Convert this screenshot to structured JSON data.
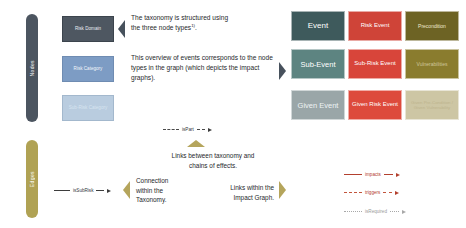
{
  "rails": {
    "nodes_label": "Nodes",
    "edges_label": "Edges"
  },
  "taxonomy_nodes": {
    "risk_domain": "Risk Domain",
    "risk_category": "Risk Category",
    "sub_risk_category": "Sub-Risk Category"
  },
  "event_grid": {
    "row1": {
      "event": "Event",
      "risk_event": "Risk Event",
      "precondition": "Precondition"
    },
    "row2": {
      "sub_event": "Sub-Event",
      "sub_risk_event": "Sub-Risk Event",
      "vulnerabilities": "Vulnerabilities"
    },
    "row3": {
      "given_event": "Given Event",
      "given_risk_event": "Given Risk Event",
      "given_precondition": "Given Pre-Condition / Given Vulnerability"
    }
  },
  "annotations": {
    "paragraph1_line1": "The taxonomy is structured using",
    "paragraph1_line2": "the three node types",
    "paragraph1_superscript": "1)",
    "paragraph1_tail": ".",
    "paragraph2": "This overview of events corresponds to the node types in the graph (which depicts the impact graphs).",
    "links_between_line1": "Links between taxonomy and",
    "links_between_line2": "chains of effects.",
    "connection_taxonomy_line1": "Connection",
    "connection_taxonomy_line2": "within the",
    "connection_taxonomy_line3": "Taxonomy.",
    "links_impact_line1": "Links within the",
    "links_impact_line2": "Impact Graph."
  },
  "edge_labels": {
    "is_part": "isPart",
    "is_sub_risk": "isSubRisk"
  },
  "edge_legend": [
    {
      "label": "impacts",
      "style": "solid",
      "color": "#b3402e"
    },
    {
      "label": "triggers",
      "style": "dashed",
      "color": "#c2553c"
    },
    {
      "label": "isRequired",
      "style": "dotted",
      "color": "#a8a8a8"
    }
  ],
  "colors": {
    "rail_nodes": "#4c5560",
    "rail_edges": "#b0a254",
    "risk_domain": "#4e5761",
    "risk_category": "#7d9cc4",
    "sub_risk_category": "#b9ccdf",
    "event": "#3e5a5c",
    "risk_event": "#cf4438",
    "precondition": "#6d6324",
    "sub_event": "#5d8481",
    "sub_risk_event": "#d8453a",
    "vulnerabilities": "#8a7c2e",
    "given_event": "#9aa6a8",
    "given_risk_event": "#dd4a3c",
    "given_precondition": "#cdc6a4",
    "chevron_dark": "#47515c",
    "chevron_gold": "#b5a55c"
  }
}
